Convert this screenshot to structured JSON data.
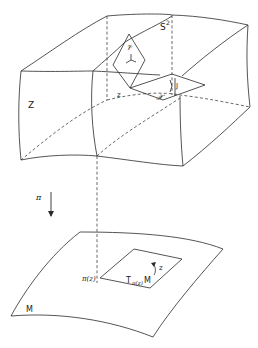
{
  "diagram": {
    "upper_box": {
      "label_Z": "Z",
      "label_S2_base": "S",
      "label_S2_sup": "2",
      "label_z_point": "z",
      "label_V": "𝒱",
      "label_H": "𝒳",
      "label_J_vertical": "J",
      "label_J_horizontal": "J"
    },
    "projection": {
      "label_pi": "π"
    },
    "lower_surface": {
      "label_M": "M",
      "label_pi_z": "π(z)",
      "label_tangent_T": "T",
      "label_tangent_sub": "π(z)",
      "label_tangent_M": "M",
      "label_z_rot": "z"
    }
  }
}
